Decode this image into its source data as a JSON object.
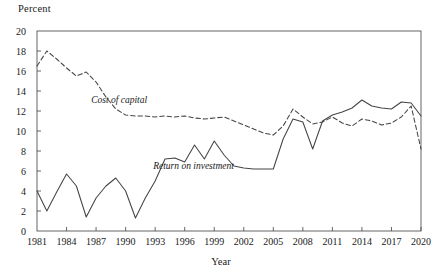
{
  "chart_data": {
    "type": "line",
    "title": "",
    "xlabel": "Year",
    "ylabel": "Percent",
    "xlim": [
      1981,
      2020
    ],
    "ylim": [
      0,
      20
    ],
    "ytick_step": 2,
    "xtick_step": 3,
    "grid": false,
    "legend_position": "inline-annotation",
    "yticks": [
      0,
      2,
      4,
      6,
      8,
      10,
      12,
      14,
      16,
      18,
      20
    ],
    "xticks": [
      1981,
      1984,
      1987,
      1990,
      1993,
      1996,
      1999,
      2002,
      2005,
      2008,
      2011,
      2014,
      2017,
      2020
    ],
    "x": [
      1981,
      1982,
      1983,
      1984,
      1985,
      1986,
      1987,
      1988,
      1989,
      1990,
      1991,
      1992,
      1993,
      1994,
      1995,
      1996,
      1997,
      1998,
      1999,
      2000,
      2001,
      2002,
      2003,
      2004,
      2005,
      2006,
      2007,
      2008,
      2009,
      2010,
      2011,
      2012,
      2013,
      2014,
      2015,
      2016,
      2017,
      2018,
      2019,
      2020
    ],
    "series": [
      {
        "name": "Cost of capital",
        "style": "dashed",
        "color": "#444444",
        "values": [
          16.5,
          18.0,
          17.2,
          16.3,
          15.5,
          15.9,
          14.9,
          13.4,
          12.2,
          11.6,
          11.5,
          11.5,
          11.4,
          11.5,
          11.4,
          11.5,
          11.3,
          11.2,
          11.3,
          11.4,
          11.0,
          10.6,
          10.2,
          9.8,
          9.6,
          10.5,
          12.2,
          11.4,
          10.7,
          10.9,
          11.4,
          10.8,
          10.5,
          11.2,
          11.0,
          10.6,
          10.8,
          11.4,
          12.5,
          8.2
        ]
      },
      {
        "name": "Return on investment",
        "style": "solid",
        "color": "#444444",
        "values": [
          4.0,
          2.0,
          3.9,
          5.7,
          4.5,
          1.4,
          3.3,
          4.5,
          5.3,
          4.0,
          1.3,
          3.3,
          5.0,
          7.2,
          7.3,
          6.9,
          8.6,
          7.2,
          9.0,
          7.6,
          6.5,
          6.3,
          6.2,
          6.2,
          6.2,
          9.2,
          11.2,
          10.9,
          8.2,
          11.0,
          11.6,
          11.9,
          12.3,
          13.1,
          12.5,
          12.3,
          12.2,
          12.9,
          12.8,
          11.5
        ]
      }
    ],
    "annotations": [
      {
        "text": "Cost of capital",
        "x": 1986.5,
        "y": 12.9
      },
      {
        "text": "Return on investment",
        "x": 1992.8,
        "y": 6.3
      }
    ]
  }
}
